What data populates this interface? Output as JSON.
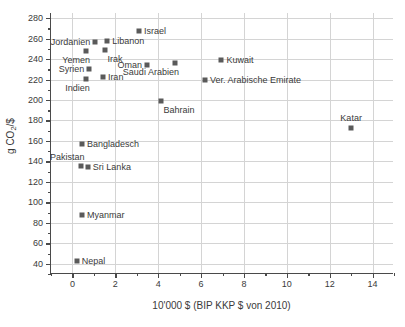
{
  "chart_data": {
    "type": "scatter",
    "title": "",
    "xlabel": "10'000 $ (BIP KKP $ von 2010)",
    "ylabel": "g CO2/$",
    "ylabel_parts": {
      "pre": "g CO",
      "sub": "2",
      "post": "/$"
    },
    "xlim": [
      -1,
      15
    ],
    "ylim": [
      30,
      285
    ],
    "xticks": [
      0,
      2,
      4,
      6,
      8,
      10,
      12,
      14
    ],
    "yticks": [
      40,
      60,
      80,
      100,
      120,
      140,
      160,
      180,
      200,
      220,
      240,
      260,
      280
    ],
    "grid": true,
    "legend": "none",
    "marker_color": "#5a5a5a",
    "axis_color": "#4a4a4a",
    "grid_color": "#d4d4d4",
    "points": [
      {
        "label": "Nepal",
        "x": 0.2,
        "y": 43,
        "pos": "right"
      },
      {
        "label": "Myanmar",
        "x": 0.45,
        "y": 88,
        "pos": "right"
      },
      {
        "label": "Pakistan",
        "x": 0.38,
        "y": 136,
        "pos": "above-left"
      },
      {
        "label": "Sri Lanka",
        "x": 0.72,
        "y": 135,
        "pos": "right"
      },
      {
        "label": "Bangladesch",
        "x": 0.45,
        "y": 157,
        "pos": "right"
      },
      {
        "label": "Indien",
        "x": 0.62,
        "y": 221,
        "pos": "below-left"
      },
      {
        "label": "Syrien",
        "x": 0.78,
        "y": 230,
        "pos": "left"
      },
      {
        "label": "Yemen",
        "x": 0.63,
        "y": 248,
        "pos": "below-left"
      },
      {
        "label": "Jordanien",
        "x": 1.07,
        "y": 257,
        "pos": "left"
      },
      {
        "label": "Iran",
        "x": 1.42,
        "y": 222,
        "pos": "right"
      },
      {
        "label": "Irak",
        "x": 1.54,
        "y": 249,
        "pos": "below-right"
      },
      {
        "label": "Libanon",
        "x": 1.62,
        "y": 258,
        "pos": "right"
      },
      {
        "label": "Israel",
        "x": 3.1,
        "y": 267,
        "pos": "right"
      },
      {
        "label": "Oman",
        "x": 3.48,
        "y": 234,
        "pos": "left"
      },
      {
        "label": "Bahrain",
        "x": 4.15,
        "y": 199,
        "pos": "below-right"
      },
      {
        "label": "Saudi Arabien",
        "x": 4.78,
        "y": 236,
        "pos": "below-left"
      },
      {
        "label": "Ver. Arabische Emirate",
        "x": 6.18,
        "y": 220,
        "pos": "right"
      },
      {
        "label": "Kuwait",
        "x": 6.95,
        "y": 239,
        "pos": "right"
      },
      {
        "label": "Katar",
        "x": 13.0,
        "y": 173,
        "pos": "above"
      }
    ]
  }
}
